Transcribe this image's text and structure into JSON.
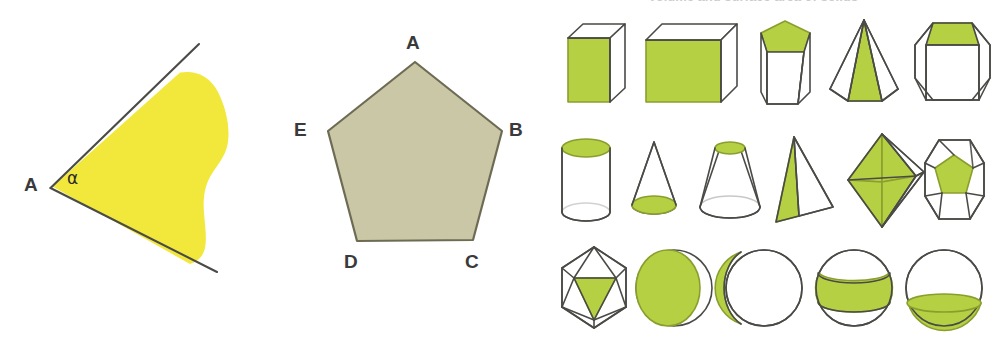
{
  "page": {
    "width": 997,
    "height": 339,
    "background": "#ffffff"
  },
  "colors": {
    "yellow_fill": "#F2E83C",
    "green_fill": "#B5D143",
    "green_stroke": "#8A9E2E",
    "khaki_fill": "#CAC7A6",
    "khaki_stroke": "#6E6B55",
    "line_dark": "#4A4A46",
    "label_text": "#3A3A3A"
  },
  "figures": [
    {
      "id": "angle-region",
      "name": "curved-sector-with-angle",
      "labels": [
        {
          "name": "vertex-label-a",
          "text": "A",
          "x": 24,
          "y": 175
        },
        {
          "name": "angle-label-alpha",
          "text": "α",
          "x": 66,
          "y": 169
        }
      ]
    },
    {
      "id": "pentagon",
      "name": "labelled-pentagon-abcde",
      "labels": [
        {
          "name": "vertex-label-a",
          "text": "A",
          "x": 405,
          "y": 33
        },
        {
          "name": "vertex-label-b",
          "text": "B",
          "x": 506,
          "y": 120
        },
        {
          "name": "vertex-label-e",
          "text": "E",
          "x": 293,
          "y": 120
        },
        {
          "name": "vertex-label-c",
          "text": "C",
          "x": 464,
          "y": 252
        },
        {
          "name": "vertex-label-d",
          "text": "D",
          "x": 344,
          "y": 252
        }
      ]
    },
    {
      "id": "solids-grid",
      "name": "geometric-solids-chart",
      "title": "Volume and surface area of solids",
      "rows": [
        {
          "name": "prisms-and-pyramids-row",
          "items": [
            {
              "name": "cube-solid",
              "label": "cube"
            },
            {
              "name": "cuboid-solid",
              "label": "cuboid"
            },
            {
              "name": "pentagonal-prism-solid",
              "label": "pentagonal prism"
            },
            {
              "name": "hexagonal-pyramid-solid",
              "label": "hexagonal pyramid"
            },
            {
              "name": "hexagonal-frustum-solid",
              "label": "hexagonal frustum"
            }
          ]
        },
        {
          "name": "round-and-platonic-row",
          "items": [
            {
              "name": "cylinder-solid",
              "label": "cylinder"
            },
            {
              "name": "cone-solid",
              "label": "cone"
            },
            {
              "name": "truncated-cone-solid",
              "label": "truncated cone"
            },
            {
              "name": "tetrahedron-solid",
              "label": "tetrahedron"
            },
            {
              "name": "octahedron-solid",
              "label": "octahedron"
            },
            {
              "name": "dodecahedron-solid",
              "label": "dodecahedron"
            }
          ]
        },
        {
          "name": "spheres-row",
          "items": [
            {
              "name": "icosahedron-solid",
              "label": "icosahedron"
            },
            {
              "name": "sphere-great-circle",
              "label": "sphere"
            },
            {
              "name": "sphere-lune",
              "label": "spherical lune"
            },
            {
              "name": "sphere-zone",
              "label": "spherical zone"
            },
            {
              "name": "sphere-cap",
              "label": "spherical cap"
            }
          ]
        }
      ]
    }
  ]
}
